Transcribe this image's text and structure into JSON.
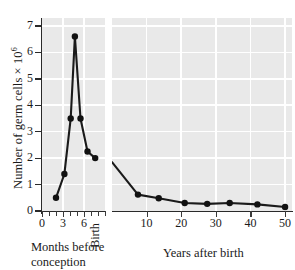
{
  "chart_data": {
    "type": "line",
    "title": "",
    "ylabel": "Number of germ cells × 10",
    "ylabel_exponent": "6",
    "ylim": [
      0,
      7.3
    ],
    "yticks": [
      0,
      1,
      2,
      3,
      4,
      5,
      6,
      7
    ],
    "ytick_labels": [
      "0",
      "1",
      "2",
      "3",
      "4",
      "5",
      "6",
      "7"
    ],
    "grid": true,
    "legend": false,
    "panels": [
      {
        "id": "left",
        "xlabel": "Months before conception",
        "xlabel_lines": [
          "Months before",
          "conception"
        ],
        "xlim": [
          0,
          9
        ],
        "xticks": [
          0,
          1,
          2,
          3,
          4,
          5,
          6,
          7,
          8,
          9
        ],
        "xtick_labels": [
          {
            "value": 0,
            "label": "0"
          },
          {
            "value": 3,
            "label": "3"
          },
          {
            "value": 6,
            "label": "6"
          }
        ],
        "x": [
          2,
          3.2,
          4.1,
          4.7,
          5.5,
          6.5,
          7.6
        ],
        "y": [
          0.5,
          1.4,
          3.5,
          6.6,
          3.5,
          2.25,
          2.0
        ]
      },
      {
        "id": "right",
        "xlabel": "Years after birth",
        "xlabel_lines": [
          "Years after birth"
        ],
        "xlim": [
          0,
          52
        ],
        "xticks": [
          10,
          20,
          30,
          40,
          50
        ],
        "xtick_labels": [
          {
            "value": 10,
            "label": "10"
          },
          {
            "value": 20,
            "label": "20"
          },
          {
            "value": 30,
            "label": "30"
          },
          {
            "value": 40,
            "label": "40"
          },
          {
            "value": 50,
            "label": "50"
          }
        ],
        "x": [
          0,
          7.5,
          13.5,
          21,
          27.5,
          34,
          42,
          50
        ],
        "y": [
          1.85,
          0.62,
          0.48,
          0.3,
          0.27,
          0.3,
          0.25,
          0.15
        ]
      }
    ],
    "annotations": [
      {
        "name": "birth-marker",
        "text": "Birth"
      }
    ],
    "colors": {
      "plot_background": "#e9e9e9",
      "gridline": "#ffffff",
      "line": "#1a1a1a",
      "marker": "#111111",
      "axis": "#2a2a2a",
      "text": "#1a1a1a",
      "page_background": "#ffffff"
    }
  }
}
